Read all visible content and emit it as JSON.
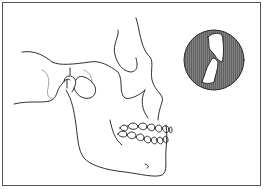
{
  "figure": {
    "subject": "Lateral view of skull showing mandible and temporomandibular joint",
    "inset": "Magnified circular detail of joint/tooth contact",
    "colors": {
      "line": "#1a1a1a",
      "inset_fill": "#d8d8d8",
      "frame": "#555555",
      "background": "#ffffff"
    }
  }
}
